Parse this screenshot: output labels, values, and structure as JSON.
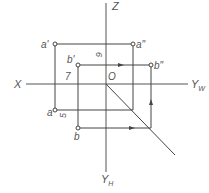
{
  "diagram": {
    "type": "orthographic-projection",
    "axes": {
      "x_label": "X",
      "z_label": "Z",
      "yw_label": "Y",
      "yw_sub": "W",
      "yh_label": "Y",
      "yh_sub": "H",
      "origin_label": "O"
    },
    "points": {
      "a_front": "a'",
      "a_side": "a\"",
      "a_top": "a",
      "b_front": "b'",
      "b_side": "b\"",
      "b_top": "b"
    },
    "dimensions": {
      "d1": "6",
      "d2": "7",
      "d3": "5"
    },
    "colors": {
      "line": "#444444",
      "text": "#555555"
    }
  }
}
